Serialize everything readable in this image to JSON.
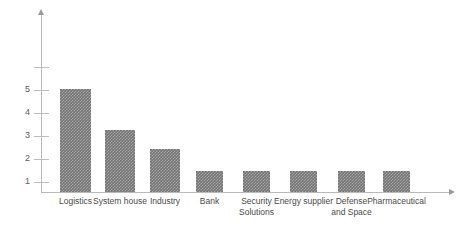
{
  "chart_data": {
    "type": "bar",
    "title": "",
    "subtitle": "",
    "xlabel": "",
    "ylabel": "",
    "categories": [
      "Logistics",
      "System house",
      "Industry",
      "Bank",
      "Security\nSolutions",
      "Energy supplier",
      "Defense\nand Space",
      "Pharmaceutical"
    ],
    "values": [
      5,
      3,
      2.1,
      1,
      1,
      1,
      1,
      1
    ],
    "ylim": [
      0,
      6
    ],
    "ytick_values": [
      1,
      2,
      3,
      4,
      5,
      6
    ],
    "ytick_labels": [
      "1",
      "2",
      "3",
      "4",
      "5",
      ""
    ],
    "grid": false,
    "legend": null,
    "bar_color": "#757575",
    "axis_color": "#b9b9b9",
    "label_color": "#4a4a4a"
  },
  "axis": {
    "y_ticks": [
      {
        "label": "1",
        "value": 1
      },
      {
        "label": "2",
        "value": 2
      },
      {
        "label": "3",
        "value": 3
      },
      {
        "label": "4",
        "value": 4
      },
      {
        "label": "5",
        "value": 5
      },
      {
        "label": "",
        "value": 6
      }
    ]
  },
  "bars": [
    {
      "label": "Logistics",
      "value": 5,
      "x": 60,
      "width": 31
    },
    {
      "label": "System house",
      "value": 3,
      "x": 105,
      "width": 30
    },
    {
      "label": "Industry",
      "value": 2.1,
      "x": 150,
      "width": 30
    },
    {
      "label": "Bank",
      "value": 1,
      "x": 196,
      "width": 27
    },
    {
      "label": "Security\nSolutions",
      "value": 1,
      "x": 243,
      "width": 27
    },
    {
      "label": "Energy supplier",
      "value": 1,
      "x": 290,
      "width": 27
    },
    {
      "label": "Defense\nand Space",
      "value": 1,
      "x": 338,
      "width": 27
    },
    {
      "label": "Pharmaceutical",
      "value": 1,
      "x": 383,
      "width": 27
    }
  ]
}
